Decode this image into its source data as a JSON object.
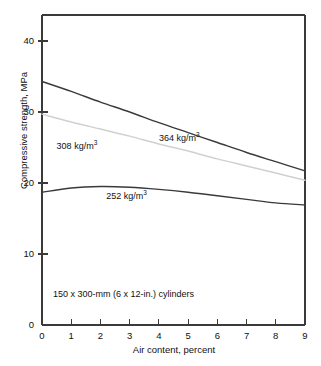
{
  "chart_data": {
    "type": "line",
    "title": "",
    "xlabel": "Air content, percent",
    "ylabel": "Compressive strength, MPa",
    "xlim": [
      0,
      9
    ],
    "ylim": [
      0,
      43
    ],
    "xticks": [
      "0",
      "1",
      "2",
      "3",
      "4",
      "5",
      "6",
      "7",
      "8",
      "9"
    ],
    "xtick_values": [
      0,
      1,
      2,
      3,
      4,
      5,
      6,
      7,
      8,
      9
    ],
    "yticks": [
      "0",
      "10",
      "20",
      "30",
      "40"
    ],
    "ytick_values": [
      0,
      10,
      20,
      30,
      40
    ],
    "grid": false,
    "legend": "inline-annotations",
    "annotations": [
      {
        "text": "150 x 300-mm (6 x 12-in.) cylinders",
        "x": 0.4,
        "y": 4.4
      }
    ],
    "series": [
      {
        "name": "364 kg/m3",
        "label": "364 kg/m",
        "label_sup": "3",
        "color": "#3a3a3a",
        "label_x": 4.0,
        "label_y": 26.2,
        "x": [
          0,
          1,
          2,
          3,
          4,
          5,
          6,
          7,
          8,
          9
        ],
        "values": [
          34.3,
          32.9,
          31.4,
          30.0,
          28.5,
          27.1,
          25.7,
          24.3,
          23.0,
          21.7
        ]
      },
      {
        "name": "308 kg/m3",
        "label": "308 kg/m",
        "label_sup": "3",
        "color": "#d0d0d0",
        "label_x": 0.5,
        "label_y": 25.1,
        "x": [
          0,
          1,
          2,
          3,
          4,
          5,
          6,
          7,
          8,
          9
        ],
        "values": [
          29.7,
          28.6,
          27.6,
          26.6,
          25.5,
          24.5,
          23.4,
          22.4,
          21.4,
          20.4
        ]
      },
      {
        "name": "252 kg/m3",
        "label": "252 kg/m",
        "label_sup": "3",
        "color": "#3a3a3a",
        "label_x": 2.2,
        "label_y": 18.0,
        "x": [
          0,
          1,
          2,
          3,
          4,
          5,
          6,
          7,
          8,
          9
        ],
        "values": [
          18.7,
          19.3,
          19.5,
          19.4,
          19.1,
          18.7,
          18.2,
          17.7,
          17.2,
          16.9
        ]
      }
    ]
  },
  "axes": {
    "x_title": "Air content, percent",
    "y_title": "Compressive strength, MPa"
  },
  "note": {
    "text": "150 x 300-mm (6 x 12-in.) cylinders"
  },
  "colors": {
    "axis": "#3a3a3a",
    "curve_dark": "#3a3a3a",
    "curve_light": "#d0d0d0",
    "text": "#111111",
    "background": "#ffffff"
  }
}
